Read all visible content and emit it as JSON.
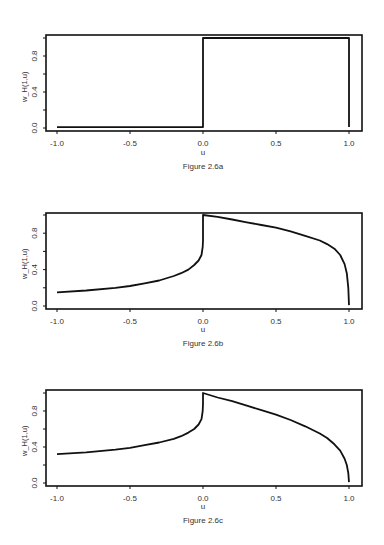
{
  "chart_data": [
    {
      "type": "line",
      "title": "",
      "caption": "Figure 2.6a",
      "xlabel": "u",
      "ylabel": "w_H(1,u)",
      "xlim": [
        -1.0,
        1.0
      ],
      "ylim": [
        0.0,
        1.0
      ],
      "xticks": [
        "-1.0",
        "-0.5",
        "0.0",
        "0.5",
        "1.0"
      ],
      "yticks": [
        0.0,
        0.2,
        0.4,
        0.6,
        0.8,
        1.0
      ],
      "ytick_labels": [
        "0.0",
        "0.4",
        "0.8"
      ],
      "grid": false,
      "legend": null,
      "series": [
        {
          "name": "w_H(1,u)",
          "x": [
            -1.0,
            0.0,
            0.0,
            1.0,
            1.0
          ],
          "y": [
            0.01,
            0.01,
            1.0,
            1.0,
            0.01
          ]
        }
      ]
    },
    {
      "type": "line",
      "title": "",
      "caption": "Figure 2.6b",
      "xlabel": "u",
      "ylabel": "w_H(1,u)",
      "xlim": [
        -1.0,
        1.0
      ],
      "ylim": [
        0.0,
        1.0
      ],
      "xticks": [
        "-1.0",
        "-0.5",
        "0.0",
        "0.5",
        "1.0"
      ],
      "yticks": [
        0.0,
        0.2,
        0.4,
        0.6,
        0.8,
        1.0
      ],
      "ytick_labels": [
        "0.0",
        "0.4",
        "0.8"
      ],
      "grid": false,
      "legend": null,
      "series": [
        {
          "name": "w_H(1,u)",
          "x": [
            -1.0,
            -0.8,
            -0.6,
            -0.5,
            -0.4,
            -0.3,
            -0.2,
            -0.15,
            -0.1,
            -0.06,
            -0.03,
            -0.01,
            -0.002,
            0.0,
            0.0,
            0.1,
            0.2,
            0.3,
            0.4,
            0.5,
            0.6,
            0.7,
            0.8,
            0.85,
            0.9,
            0.94,
            0.97,
            0.985,
            0.995,
            1.0
          ],
          "y": [
            0.15,
            0.17,
            0.2,
            0.22,
            0.25,
            0.28,
            0.33,
            0.36,
            0.4,
            0.45,
            0.5,
            0.56,
            0.65,
            0.72,
            1.0,
            0.98,
            0.95,
            0.92,
            0.89,
            0.86,
            0.82,
            0.77,
            0.72,
            0.68,
            0.63,
            0.56,
            0.46,
            0.36,
            0.2,
            0.01
          ]
        }
      ]
    },
    {
      "type": "line",
      "title": "",
      "caption": "Figure 2.6c",
      "xlabel": "u",
      "ylabel": "w_H(1,u)",
      "xlim": [
        -1.0,
        1.0
      ],
      "ylim": [
        0.0,
        1.0
      ],
      "xticks": [
        "-1.0",
        "-0.5",
        "0.0",
        "0.5",
        "1.0"
      ],
      "yticks": [
        0.0,
        0.2,
        0.4,
        0.6,
        0.8,
        1.0
      ],
      "ytick_labels": [
        "0.0",
        "0.4",
        "0.8"
      ],
      "grid": false,
      "legend": null,
      "series": [
        {
          "name": "w_H(1,u)",
          "x": [
            -1.0,
            -0.8,
            -0.6,
            -0.5,
            -0.4,
            -0.3,
            -0.2,
            -0.15,
            -0.1,
            -0.06,
            -0.03,
            -0.01,
            -0.002,
            0.0,
            0.0,
            0.1,
            0.2,
            0.3,
            0.4,
            0.5,
            0.6,
            0.7,
            0.8,
            0.85,
            0.9,
            0.94,
            0.97,
            0.985,
            0.995,
            1.0
          ],
          "y": [
            0.32,
            0.34,
            0.37,
            0.39,
            0.42,
            0.45,
            0.49,
            0.52,
            0.56,
            0.6,
            0.65,
            0.71,
            0.8,
            0.88,
            1.0,
            0.95,
            0.91,
            0.86,
            0.81,
            0.76,
            0.7,
            0.63,
            0.55,
            0.5,
            0.43,
            0.36,
            0.27,
            0.2,
            0.11,
            0.01
          ]
        }
      ]
    }
  ],
  "panels": [
    {
      "caption": "Figure 2.6a",
      "xlabel": "u",
      "ylabel": "w_H(1,u)"
    },
    {
      "caption": "Figure 2.6b",
      "xlabel": "u",
      "ylabel": "w_H(1,u)"
    },
    {
      "caption": "Figure 2.6c",
      "xlabel": "u",
      "ylabel": "w_H(1,u)"
    }
  ]
}
